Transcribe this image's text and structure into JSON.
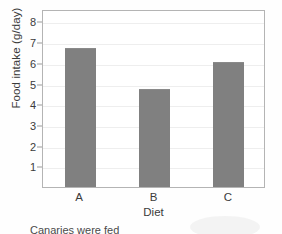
{
  "chart_data": {
    "type": "bar",
    "title": "",
    "xlabel": "Diet",
    "ylabel": "Food intake (g/day)",
    "categories": [
      "A",
      "B",
      "C"
    ],
    "values": [
      6.7,
      4.75,
      6.05
    ],
    "ylim": [
      0,
      8.6
    ],
    "yticks": [
      1,
      2,
      3,
      4,
      5,
      6,
      7,
      8
    ],
    "ytick_labels": [
      "1",
      "2",
      "3",
      "4",
      "5",
      "6",
      "7",
      "8"
    ],
    "grid": true,
    "legend": false,
    "bar_color": "#808080",
    "frame_color": "#b4b4b4",
    "gridline_color": "#eeeeee"
  },
  "caption": {
    "text": "Canaries were fed"
  }
}
